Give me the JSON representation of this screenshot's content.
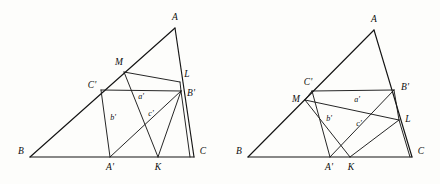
{
  "figure": {
    "type": "geometry-diagram-pair",
    "canvas": {
      "width": 440,
      "height": 184
    },
    "background_color": "#fdfdfb",
    "line_color": "#141414"
  },
  "diagrams": [
    {
      "id": "left-diagram",
      "name": "left-triangle-construction",
      "points": {
        "A": {
          "x": 175,
          "y": 28,
          "label": "A",
          "lx": 175,
          "ly": 18
        },
        "B": {
          "x": 30,
          "y": 157,
          "label": "B",
          "lx": 21,
          "ly": 152
        },
        "C": {
          "x": 194,
          "y": 157,
          "label": "C",
          "lx": 203,
          "ly": 152
        },
        "M": {
          "x": 124,
          "y": 72,
          "label": "M",
          "lx": 119,
          "ly": 63
        },
        "L": {
          "x": 180,
          "y": 82,
          "label": "L",
          "lx": 187,
          "ly": 75
        },
        "Cp": {
          "x": 101,
          "y": 90,
          "label": "C'",
          "lx": 92,
          "ly": 86
        },
        "Bp": {
          "x": 180,
          "y": 91,
          "label": "B'",
          "lx": 190,
          "ly": 93
        },
        "Ap": {
          "x": 110,
          "y": 157,
          "label": "A'",
          "lx": 110,
          "ly": 168
        },
        "K": {
          "x": 158,
          "y": 157,
          "label": "K",
          "lx": 158,
          "ly": 168
        }
      },
      "side_labels": [
        {
          "name": "a-prime",
          "text": "a'",
          "x": 141,
          "y": 97
        },
        {
          "name": "b-prime",
          "text": "b'",
          "x": 113,
          "y": 118
        },
        {
          "name": "c-prime",
          "text": "c'",
          "x": 151,
          "y": 114
        }
      ],
      "edges": [
        {
          "name": "side-AB",
          "from": "A",
          "to": "B"
        },
        {
          "name": "side-BC",
          "from": "B",
          "to": "C"
        },
        {
          "name": "side-AC",
          "from": "A",
          "to": "C"
        },
        {
          "name": "segment-M-L",
          "from": "M",
          "to": "L"
        },
        {
          "name": "segment-Cprime-Bprime",
          "from": "Cp",
          "to": "Bp"
        },
        {
          "name": "segment-Cprime-Aprime",
          "from": "Cp",
          "to": "Ap"
        },
        {
          "name": "segment-M-K",
          "from": "M",
          "to": "K"
        },
        {
          "name": "segment-Aprime-Bprime",
          "from": "Ap",
          "to": "Bp"
        },
        {
          "name": "segment-K-Bprime",
          "from": "K",
          "to": "Bp"
        },
        {
          "name": "segment-Bprime-C",
          "from": "Bp",
          "to": "C"
        },
        {
          "name": "segment-L-Bprime",
          "from": "L",
          "to": "Bp"
        }
      ]
    },
    {
      "id": "right-diagram",
      "name": "right-triangle-construction",
      "points": {
        "A": {
          "x": 374,
          "y": 30,
          "label": "A",
          "lx": 374,
          "ly": 20
        },
        "B": {
          "x": 248,
          "y": 157,
          "label": "B",
          "lx": 239,
          "ly": 152
        },
        "C": {
          "x": 412,
          "y": 157,
          "label": "C",
          "lx": 421,
          "ly": 152
        },
        "M": {
          "x": 305,
          "y": 100,
          "label": "M",
          "lx": 296,
          "ly": 100
        },
        "L": {
          "x": 399,
          "y": 120,
          "label": "L",
          "lx": 408,
          "ly": 120
        },
        "Cp": {
          "x": 312,
          "y": 91,
          "label": "C'",
          "lx": 308,
          "ly": 83
        },
        "Bp": {
          "x": 394,
          "y": 90,
          "label": "B'",
          "lx": 404,
          "ly": 89
        },
        "Ap": {
          "x": 330,
          "y": 157,
          "label": "A'",
          "lx": 329,
          "ly": 168
        },
        "K": {
          "x": 350,
          "y": 157,
          "label": "K",
          "lx": 351,
          "ly": 168
        }
      },
      "side_labels": [
        {
          "name": "a-prime",
          "text": "a'",
          "x": 357,
          "y": 100
        },
        {
          "name": "b-prime",
          "text": "b'",
          "x": 329,
          "y": 119
        },
        {
          "name": "c-prime",
          "text": "c'",
          "x": 359,
          "y": 124
        }
      ],
      "edges": [
        {
          "name": "side-AB",
          "from": "A",
          "to": "B"
        },
        {
          "name": "side-BC",
          "from": "B",
          "to": "C"
        },
        {
          "name": "side-AC",
          "from": "A",
          "to": "C"
        },
        {
          "name": "segment-Cprime-Bprime",
          "from": "Cp",
          "to": "Bp"
        },
        {
          "name": "segment-M-L",
          "from": "M",
          "to": "L"
        },
        {
          "name": "segment-M-Cprime",
          "from": "M",
          "to": "Cp"
        },
        {
          "name": "segment-Cprime-Aprime",
          "from": "Cp",
          "to": "Ap"
        },
        {
          "name": "segment-M-K",
          "from": "M",
          "to": "K"
        },
        {
          "name": "segment-Aprime-Bprime",
          "from": "Ap",
          "to": "Bp"
        },
        {
          "name": "segment-K-L",
          "from": "K",
          "to": "L"
        },
        {
          "name": "segment-Bprime-L",
          "from": "Bp",
          "to": "L"
        },
        {
          "name": "segment-L-C",
          "from": "L",
          "to": "C"
        }
      ]
    }
  ]
}
